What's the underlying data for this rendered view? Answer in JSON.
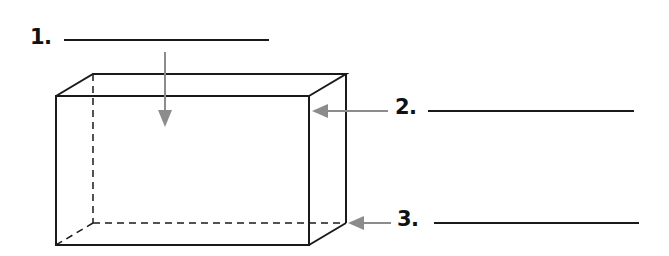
{
  "diagram": {
    "colors": {
      "edges": "#1a1a1a",
      "arrows": "#8c8c8c",
      "text": "#111111",
      "background": "#ffffff"
    },
    "labels": [
      {
        "number": "1.",
        "answer": "",
        "points_to": "top face"
      },
      {
        "number": "2.",
        "answer": "",
        "points_to": "edge"
      },
      {
        "number": "3.",
        "answer": "",
        "points_to": "vertex"
      }
    ]
  }
}
